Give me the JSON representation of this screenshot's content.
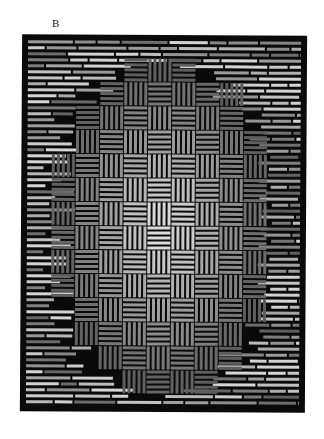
{
  "figure": {
    "label": "B",
    "colors": {
      "background": "#ffffff",
      "frame": "#0a0a0a",
      "bar_dark": "#4a4a4a",
      "bar_mid": "#7a7a7a",
      "bar_light": "#b5b5b5",
      "bar_bright": "#e0e0e0"
    }
  }
}
